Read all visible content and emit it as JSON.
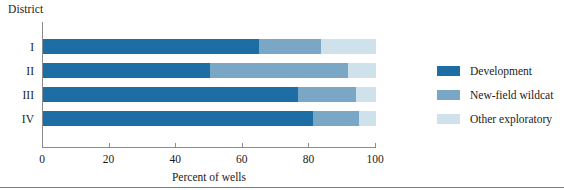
{
  "chart_data": {
    "type": "bar",
    "orientation": "horizontal",
    "stacked": true,
    "title": "",
    "xlabel": "Percent of wells",
    "ylabel": "District",
    "xlim": [
      0,
      100
    ],
    "xticks": [
      0,
      20,
      40,
      60,
      80,
      100
    ],
    "xtick_labels": [
      "0",
      "20",
      "40",
      "60",
      "80",
      "100"
    ],
    "grid": false,
    "legend_position": "right",
    "categories": [
      "I",
      "II",
      "III",
      "IV"
    ],
    "series": [
      {
        "name": "Development",
        "color": "#1c6ea4",
        "values": [
          65,
          50,
          76.5,
          81
        ]
      },
      {
        "name": "New-field wildcat",
        "color": "#7ba7c7",
        "values": [
          18.5,
          41.5,
          17.5,
          14
        ]
      },
      {
        "name": "Other exploratory",
        "color": "#cfe2ec",
        "values": [
          16.5,
          8.5,
          6,
          5
        ]
      }
    ]
  },
  "legend": {
    "items": [
      {
        "label": "Development",
        "color": "#1c6ea4"
      },
      {
        "label": "New-field wildcat",
        "color": "#7ba7c7"
      },
      {
        "label": "Other exploratory",
        "color": "#cfe2ec"
      }
    ]
  },
  "colors": {
    "development": "#1c6ea4",
    "new_field_wildcat": "#7ba7c7",
    "other_exploratory": "#cfe2ec",
    "axis": "#8b8b8b",
    "rule": "#4d8fa6",
    "text": "#1b1b1b"
  }
}
